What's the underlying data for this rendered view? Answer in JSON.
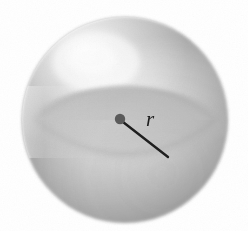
{
  "figure": {
    "name": "sphere-with-radius",
    "kind": "geometry-diagram",
    "background_color": "#ffffff",
    "caption": ""
  },
  "sphere": {
    "name": "sphere",
    "center": {
      "x": 125,
      "y": 120
    },
    "radius_px": 103,
    "fill_light": "#fbfbfb",
    "fill_mid": "#d0d0d0",
    "fill_dark": "#9a9a9a",
    "edge_color": "#8e8e8e",
    "highlight": {
      "x": 96,
      "y": 62,
      "color": "#fdfdfd"
    }
  },
  "equator": {
    "name": "equatorial-cross-section",
    "center": {
      "x": 125,
      "y": 120
    },
    "rx": 90,
    "ry": 33,
    "band_top_color": "#c6c6c6",
    "band_bottom_color": "#b0b0b0",
    "edge_color": "#a5a5a5"
  },
  "center_dot": {
    "name": "center-point",
    "x": 120,
    "y": 119,
    "r": 5.2,
    "color": "#5b5b5b"
  },
  "radius_line": {
    "name": "radius-segment",
    "x1": 123,
    "y1": 122,
    "x2": 168,
    "y2": 157,
    "color": "#1f1f1f",
    "width": 2.4
  },
  "labels": {
    "radius": {
      "text": "r",
      "x": 150,
      "y": 126,
      "color": "#1d1d1d",
      "font_size_px": 21,
      "style": "italic"
    }
  },
  "noise": {
    "name": "scan-grain",
    "opacity": 0.05
  }
}
